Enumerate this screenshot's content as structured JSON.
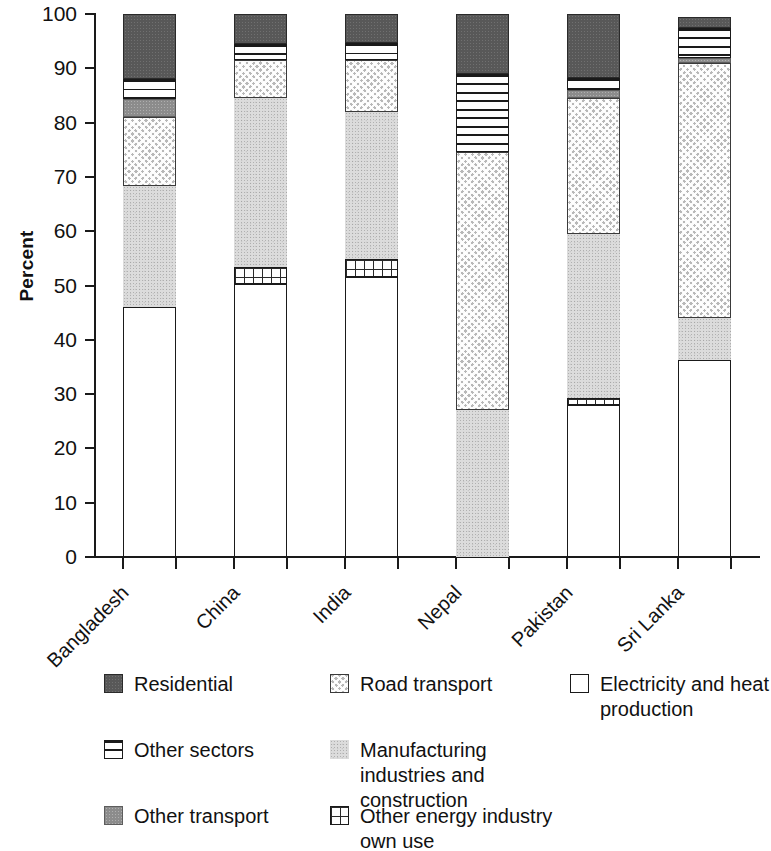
{
  "chart_data": {
    "type": "bar",
    "subtype": "stacked-bar-100",
    "title": "",
    "xlabel": "",
    "ylabel": "Percent",
    "ylim": [
      0,
      100
    ],
    "yticks": [
      0,
      10,
      20,
      30,
      40,
      50,
      60,
      70,
      80,
      90,
      100
    ],
    "ytick_labels": [
      "0",
      "10",
      "20",
      "30",
      "40",
      "50",
      "60",
      "70",
      "80",
      "90",
      "100"
    ],
    "grid": false,
    "legend_position": "below",
    "categories": [
      "Bangladesh",
      "China",
      "India",
      "Nepal",
      "Pakistan",
      "Sri Lanka"
    ],
    "series": [
      {
        "name": "Electricity and heat production",
        "key": "electricity",
        "pattern": "open-white-box",
        "color": "#ffffff",
        "values": [
          46.0,
          50.3,
          51.6,
          0.0,
          28.0,
          36.3
        ]
      },
      {
        "name": "Other energy industry own use",
        "key": "other_energy",
        "pattern": "grid",
        "color": "#ffffff",
        "values": [
          0.0,
          3.2,
          3.3,
          0.0,
          1.2,
          0.0
        ]
      },
      {
        "name": "Manufacturing industries and construction",
        "key": "manufacturing",
        "pattern": "light-stipple",
        "color": "#dcdcdc",
        "values": [
          22.3,
          31.0,
          27.1,
          27.0,
          30.3,
          7.8
        ]
      },
      {
        "name": "Road transport",
        "key": "road_transport",
        "pattern": "checker-crosshatch",
        "color": "#b8b8b8",
        "values": [
          12.8,
          7.0,
          9.5,
          47.5,
          25.0,
          46.8
        ]
      },
      {
        "name": "Other transport",
        "key": "other_transport",
        "pattern": "medium-stipple",
        "color": "#8c8c8c",
        "values": [
          3.3,
          0.0,
          0.0,
          0.0,
          1.5,
          1.0
        ]
      },
      {
        "name": "Other sectors",
        "key": "other_sectors",
        "pattern": "horizontal-lines",
        "color": "#ffffff",
        "values": [
          3.6,
          3.0,
          3.1,
          14.5,
          2.3,
          5.5
        ]
      },
      {
        "name": "Residential",
        "key": "residential",
        "pattern": "dark-solid",
        "color": "#585858",
        "values": [
          12.0,
          5.5,
          5.4,
          11.0,
          11.7,
          2.1
        ]
      }
    ],
    "bar_totals": [
      100,
      100,
      100,
      100,
      100,
      99.5
    ],
    "stack_order_bottom_to_top": [
      "electricity",
      "other_energy",
      "manufacturing",
      "road_transport",
      "other_transport",
      "other_sectors",
      "residential"
    ]
  },
  "axis": {
    "y_title": "Percent",
    "y_tick_labels": [
      "100",
      "90",
      "80",
      "70",
      "60",
      "50",
      "40",
      "30",
      "20",
      "10",
      "0"
    ],
    "x_tick_labels": [
      "Bangladesh",
      "China",
      "India",
      "Nepal",
      "Pakistan",
      "Sri Lanka"
    ]
  },
  "legend": {
    "items": [
      {
        "label": "Residential",
        "key": "residential"
      },
      {
        "label": "Road transport",
        "key": "road_transport"
      },
      {
        "label": "Electricity and heat production",
        "key": "electricity"
      },
      {
        "label": "Other sectors",
        "key": "other_sectors"
      },
      {
        "label": "Manufacturing industries and construction",
        "key": "manufacturing"
      },
      {
        "label": "Other transport",
        "key": "other_transport"
      },
      {
        "label": "Other energy industry own use",
        "key": "other_energy"
      }
    ]
  },
  "colors": {
    "residential": "#585858",
    "road_transport": "#b8b8b8",
    "other_transport": "#8c8c8c",
    "manufacturing": "#dcdcdc",
    "other_sectors": "#ffffff",
    "other_energy": "#ffffff",
    "electricity": "#ffffff",
    "axis": "#1a1a1a",
    "background": "#ffffff"
  }
}
